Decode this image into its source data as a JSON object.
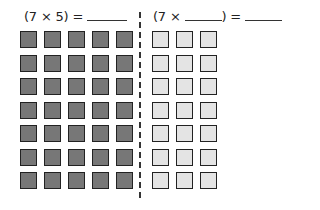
{
  "left_equation": {
    "text": "(7 × 5) = ",
    "blank": "______"
  },
  "right_equation": {
    "open": "(7 × ",
    "close": ") = ",
    "blank1": "______",
    "blank2": "______"
  },
  "left_grid": {
    "rows": 7,
    "cols": 5,
    "fill": "#777777"
  },
  "right_grid": {
    "rows": 7,
    "cols": 3,
    "fill": "#e4e4e4"
  }
}
